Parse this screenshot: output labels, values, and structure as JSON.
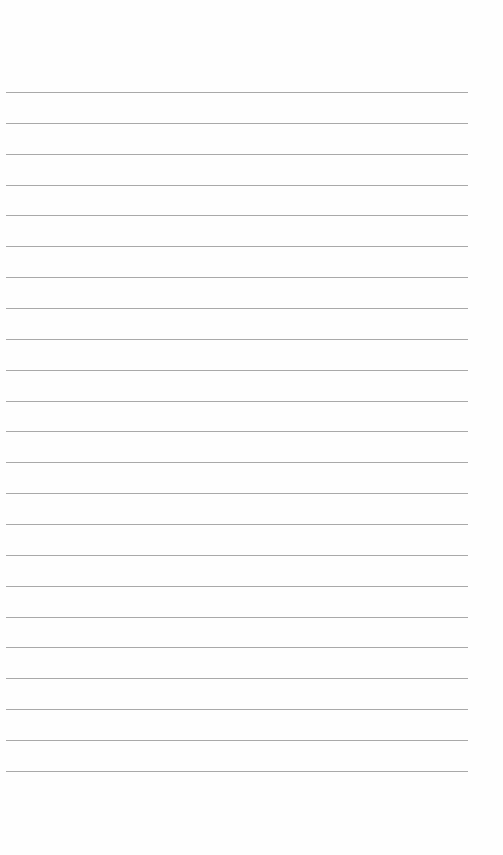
{
  "page": {
    "type": "lined-paper",
    "background_color": "#fefefe",
    "line_color": "#a9a9a9",
    "line_count": 23,
    "first_line_y": 92,
    "line_spacing": 30.86,
    "line_left_x": 6,
    "line_right_x": 468
  }
}
